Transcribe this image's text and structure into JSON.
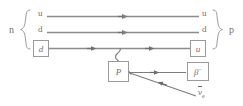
{
  "diagram": {
    "background_color": "#ffffff",
    "line_color": "#8c8c8c",
    "text_color": "#6f6f6f",
    "box_border_color": "#9a9a9a"
  },
  "initial_particle": {
    "label": "n",
    "brace": "{"
  },
  "final_particle": {
    "label": "p",
    "brace": "}"
  },
  "quark_lines": [
    {
      "name": "up-quark-spectator-1",
      "left_label": "u",
      "right_label": "u",
      "boxed_left": false,
      "boxed_right": false,
      "arrows": 1
    },
    {
      "name": "down-quark-spectator",
      "left_label": "d",
      "right_label": "d",
      "boxed_left": false,
      "boxed_right": false,
      "arrows": 1
    },
    {
      "name": "decaying-quark",
      "left_label": "d",
      "right_label": "u",
      "boxed_left": true,
      "boxed_right": true,
      "arrows": 2
    }
  ],
  "boson": {
    "name": "w-boson-propagator",
    "label": "P",
    "boxed": true,
    "style": "wavy"
  },
  "leptons": [
    {
      "name": "electron",
      "label_main": "β",
      "label_sup": "−",
      "boxed": true,
      "direction": "outgoing-right"
    },
    {
      "name": "electron-antineutrino",
      "label_main": "ν",
      "label_sub": "e",
      "overline": true,
      "boxed": false,
      "direction": "incoming-from-lower-right"
    }
  ]
}
